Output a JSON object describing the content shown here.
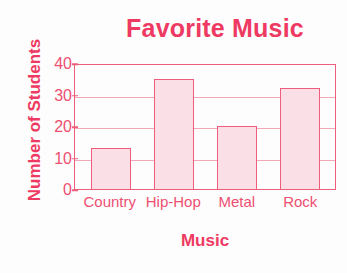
{
  "chart_data": {
    "type": "bar",
    "title": "Favorite Music",
    "xlabel": "Music",
    "ylabel": "Number of Students",
    "categories": [
      "Country",
      "Hip-Hop",
      "Metal",
      "Rock"
    ],
    "values": [
      13,
      35,
      20,
      32
    ],
    "ylim": [
      0,
      40
    ],
    "yticks": [
      0,
      10,
      20,
      30,
      40
    ],
    "grid": true,
    "legend": "none",
    "colors": {
      "ink": "#ee3a62",
      "bar_fill": "#fae0e6",
      "bar_stroke": "#ef5d7c",
      "gridline": "#f3a8b9",
      "background": "#fdfdfd"
    }
  }
}
